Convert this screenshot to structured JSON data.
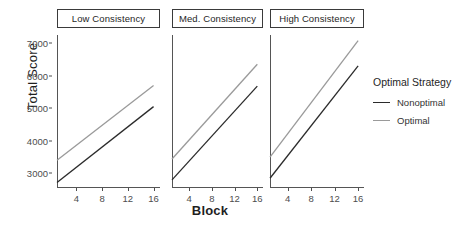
{
  "chart_data": {
    "type": "line",
    "title": "",
    "xlabel": "Block",
    "ylabel": "Total Score",
    "xlim": [
      1,
      17
    ],
    "ylim": [
      2550,
      7250
    ],
    "xticks": [
      4,
      8,
      12,
      16
    ],
    "yticks": [
      3000,
      4000,
      5000,
      6000,
      7000
    ],
    "grid": false,
    "legend": {
      "title": "Optimal Strategy",
      "position": "right",
      "entries": [
        {
          "name": "Nonoptimal",
          "color": "#2b2b2b"
        },
        {
          "name": "Optimal",
          "color": "#9a9a9a"
        }
      ]
    },
    "facet_variable": "Consistency",
    "facets": [
      {
        "label": "Low Consistency",
        "series": [
          {
            "name": "Nonoptimal",
            "color": "#2b2b2b",
            "x": [
              1,
              16
            ],
            "y": [
              2720,
              5050
            ]
          },
          {
            "name": "Optimal",
            "color": "#9a9a9a",
            "x": [
              1,
              16
            ],
            "y": [
              3400,
              5700
            ]
          }
        ]
      },
      {
        "label": "Med. Consistency",
        "series": [
          {
            "name": "Nonoptimal",
            "color": "#2b2b2b",
            "x": [
              1,
              16
            ],
            "y": [
              2800,
              5680
            ]
          },
          {
            "name": "Optimal",
            "color": "#9a9a9a",
            "x": [
              1,
              16
            ],
            "y": [
              3440,
              6350
            ]
          }
        ]
      },
      {
        "label": "High Consistency",
        "series": [
          {
            "name": "Nonoptimal",
            "color": "#2b2b2b",
            "x": [
              1,
              16
            ],
            "y": [
              2850,
              6300
            ]
          },
          {
            "name": "Optimal",
            "color": "#9a9a9a",
            "x": [
              1,
              16
            ],
            "y": [
              3500,
              7080
            ]
          }
        ]
      }
    ]
  }
}
